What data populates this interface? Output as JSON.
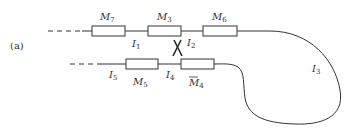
{
  "panel_label": "(a)",
  "modules_top": [
    {
      "id": "M7",
      "base": "M",
      "sub": "7"
    },
    {
      "id": "M3",
      "base": "M",
      "sub": "3"
    },
    {
      "id": "M6",
      "base": "M",
      "sub": "6"
    }
  ],
  "modules_bottom": [
    {
      "id": "M5",
      "base": "M",
      "sub": "5"
    },
    {
      "id": "M4bar",
      "base": "M",
      "sub": "4",
      "overline": true
    }
  ],
  "intervals": [
    {
      "id": "I1",
      "base": "I",
      "sub": "1"
    },
    {
      "id": "I2",
      "base": "I",
      "sub": "2"
    },
    {
      "id": "I3",
      "base": "I",
      "sub": "3"
    },
    {
      "id": "I4",
      "base": "I",
      "sub": "4"
    },
    {
      "id": "I5",
      "base": "I",
      "sub": "5"
    }
  ],
  "colors": {
    "stroke": "#333333",
    "background": "#ffffff"
  }
}
